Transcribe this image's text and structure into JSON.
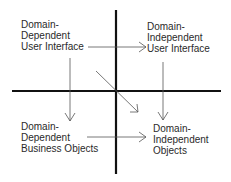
{
  "diagram": {
    "colors": {
      "axis": "#111111",
      "arrow": "#555555",
      "text": "#2a2a2a",
      "background": "#ffffff"
    },
    "quadrants": [
      {
        "id": "dd-ui",
        "lines": [
          "Domain-",
          "Dependent",
          "User Interface"
        ]
      },
      {
        "id": "di-ui",
        "lines": [
          "Domain-",
          "Independent",
          "User Interface"
        ]
      },
      {
        "id": "dd-bo",
        "lines": [
          "Domain-",
          "Dependent",
          "Business Objects"
        ]
      },
      {
        "id": "di-obj",
        "lines": [
          "Domain-",
          "Independent",
          "Objects"
        ]
      }
    ],
    "arrows": [
      {
        "from": "dd-ui",
        "to": "di-ui"
      },
      {
        "from": "dd-ui",
        "to": "dd-bo"
      },
      {
        "from": "di-ui",
        "to": "di-obj"
      },
      {
        "from": "dd-bo",
        "to": "di-obj"
      },
      {
        "from": "dd-ui",
        "to": "di-obj"
      }
    ]
  }
}
